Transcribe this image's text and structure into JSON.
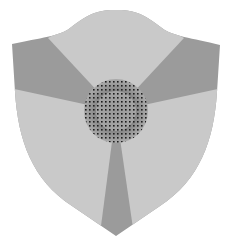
{
  "emblem": {
    "name": "shield-trefoil-emblem",
    "shape": "shield",
    "pattern": "three light sectors alternating with three dark wedges around a stippled center disc",
    "colors": {
      "background": "#ffffff",
      "shield_dark": "#9b9b9b",
      "sector_light": "#c9c9c9",
      "center_disc": "#bdbdbd",
      "stipple": "#1a1a1a"
    },
    "center": {
      "x": 116,
      "y": 111,
      "radius": 32
    }
  }
}
